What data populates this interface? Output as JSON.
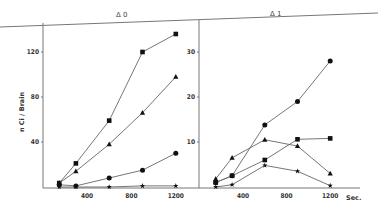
{
  "chart_data": [
    {
      "type": "line",
      "panel_label": "Δ 0",
      "title": "Δ 0",
      "xlabel": "Sec.",
      "ylabel": "n Ci / Brain",
      "x_ticks": [
        400,
        800,
        1200
      ],
      "y_ticks": [
        40,
        80,
        120
      ],
      "xlim": [
        0,
        1200
      ],
      "ylim": [
        0,
        140
      ],
      "grid": false,
      "x": [
        150,
        300,
        600,
        900,
        1200
      ],
      "series": [
        {
          "name": "square",
          "marker": "square",
          "values": [
            3.5,
            21,
            59,
            120,
            136
          ]
        },
        {
          "name": "triangle",
          "marker": "triangle",
          "values": [
            3.5,
            14,
            38,
            66,
            98
          ]
        },
        {
          "name": "circle",
          "marker": "circle",
          "values": [
            2,
            1,
            8,
            15,
            30
          ]
        },
        {
          "name": "star",
          "marker": "star",
          "values": [
            0,
            0,
            0,
            1,
            1
          ]
        }
      ]
    },
    {
      "type": "line",
      "panel_label": "Δ 1",
      "title": "Δ 1",
      "xlabel": "Sec.",
      "ylabel": "",
      "x_ticks": [
        400,
        800,
        1200
      ],
      "y_ticks": [
        10,
        20,
        30
      ],
      "xlim": [
        0,
        1200
      ],
      "ylim": [
        0,
        35
      ],
      "grid": false,
      "x": [
        150,
        300,
        600,
        900,
        1200
      ],
      "series": [
        {
          "name": "circle",
          "marker": "circle",
          "values": [
            1,
            2.5,
            13.8,
            19,
            28
          ]
        },
        {
          "name": "square",
          "marker": "square",
          "values": [
            1,
            2.5,
            6,
            10.6,
            10.8
          ]
        },
        {
          "name": "triangle",
          "marker": "triangle",
          "values": [
            1.8,
            6.5,
            10.5,
            9.1,
            3
          ]
        },
        {
          "name": "star",
          "marker": "star",
          "values": [
            0,
            0.5,
            4.8,
            3.5,
            0.3
          ]
        }
      ]
    }
  ],
  "labels": {
    "panel0": "Δ 0",
    "panel1": "Δ 1",
    "y_title": "n Ci / Brain",
    "x_title": "Sec.",
    "left_y_ticks": [
      "40",
      "80",
      "120"
    ],
    "right_y_ticks": [
      "10",
      "20",
      "30"
    ],
    "x_ticks": [
      "400",
      "800",
      "1200"
    ]
  }
}
